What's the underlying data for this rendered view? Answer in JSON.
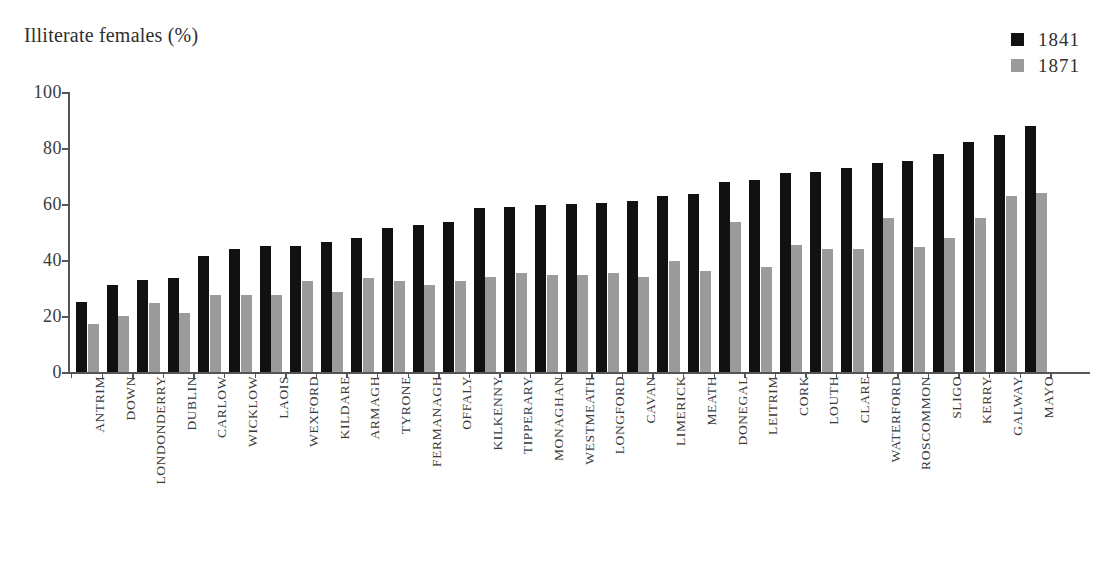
{
  "chart_data": {
    "type": "bar",
    "title": "Illiterate females (%)",
    "xlabel": "",
    "ylabel": "Illiterate females (%)",
    "ylim": [
      0,
      100
    ],
    "yticks": [
      0,
      20,
      40,
      60,
      80,
      100
    ],
    "ytick_labels": [
      "0",
      "20",
      "40",
      "60",
      "80",
      "100"
    ],
    "grid": false,
    "legend_position": "top-right",
    "categories": [
      "ANTRIM",
      "DOWN",
      "LONDONDERRY",
      "DUBLIN",
      "CARLOW",
      "WICKLOW",
      "LAOIS",
      "WEXFORD",
      "KILDARE",
      "ARMAGH",
      "TYRONE",
      "FERMANAGH",
      "OFFALY",
      "KILKENNY",
      "TIPPERARY",
      "MONAGHAN",
      "WESTMEATH",
      "LONGFORD",
      "CAVAN",
      "LIMERICK",
      "MEATH",
      "DONEGAL",
      "LEITRIM",
      "CORK",
      "LOUTH",
      "CLARE",
      "WATERFORD",
      "ROSCOMMON",
      "SLIGO",
      "KERRY",
      "GALWAY",
      "MAYO"
    ],
    "series": [
      {
        "name": "1841",
        "color": "#111111",
        "values": [
          25,
          31,
          33,
          33.5,
          41.5,
          44,
          45,
          45,
          46.5,
          48,
          51.5,
          52.5,
          53.5,
          58.5,
          59,
          59.5,
          60,
          60.5,
          61,
          63,
          63.5,
          68,
          68.5,
          71,
          71.5,
          73,
          74.5,
          75.5,
          78,
          82,
          84.5,
          88
        ]
      },
      {
        "name": "1871",
        "color": "#9b9b9b",
        "values": [
          17,
          20,
          24.5,
          21,
          27.5,
          27.5,
          27.5,
          32.5,
          28.5,
          33.5,
          32.5,
          31,
          32.5,
          34,
          35.5,
          34.5,
          34.5,
          35.5,
          34,
          39.5,
          36,
          53.5,
          37.5,
          45.5,
          44,
          44,
          55,
          44.5,
          48,
          55,
          63,
          64
        ]
      }
    ]
  },
  "legend": {
    "items": [
      {
        "label": "1841",
        "color": "#111111"
      },
      {
        "label": "1871",
        "color": "#9b9b9b"
      }
    ]
  }
}
